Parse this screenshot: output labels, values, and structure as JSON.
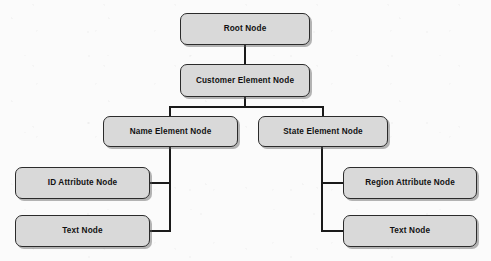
{
  "diagram": {
    "type": "tree-diagram",
    "colors": {
      "node_fill": "#d9d9d9",
      "node_border": "#2b2b2b",
      "edge": "#1a1a1a",
      "background": "#fbfbfb",
      "text": "#111111",
      "shadow": "#5a5a5a"
    },
    "nodes": [
      {
        "id": "root",
        "label": "Root Node",
        "x": 180,
        "y": 13,
        "w": 130,
        "h": 32
      },
      {
        "id": "customer",
        "label": "Customer Element Node",
        "x": 180,
        "y": 64,
        "w": 130,
        "h": 33
      },
      {
        "id": "name",
        "label": "Name Element Node",
        "x": 103,
        "y": 116,
        "w": 135,
        "h": 31
      },
      {
        "id": "state",
        "label": "State Element Node",
        "x": 258,
        "y": 116,
        "w": 130,
        "h": 31
      },
      {
        "id": "id_attr",
        "label": "ID Attribute Node",
        "x": 15,
        "y": 167,
        "w": 135,
        "h": 32
      },
      {
        "id": "text_left",
        "label": "Text Node",
        "x": 15,
        "y": 215,
        "w": 135,
        "h": 32
      },
      {
        "id": "region",
        "label": "Region Attribute Node",
        "x": 343,
        "y": 167,
        "w": 134,
        "h": 32
      },
      {
        "id": "text_right",
        "label": "Text Node",
        "x": 343,
        "y": 215,
        "w": 134,
        "h": 32
      }
    ],
    "edges": [
      {
        "id": "root-to-customer",
        "from": "root",
        "to": "customer",
        "path": "M245,45 L245,64"
      },
      {
        "id": "customer-to-branch",
        "from": "customer",
        "to": "branch-bar",
        "path": "M245,97 L245,107"
      },
      {
        "id": "branch-bar",
        "from": "customer",
        "to": "children",
        "path": "M170,107 L323,107"
      },
      {
        "id": "branch-to-name",
        "from": "branch-bar",
        "to": "name",
        "path": "M170,107 L170,116"
      },
      {
        "id": "branch-to-state",
        "from": "branch-bar",
        "to": "state",
        "path": "M323,107 L323,116"
      },
      {
        "id": "name-stem",
        "from": "name",
        "to": "name-children",
        "path": "M170,147 L170,231"
      },
      {
        "id": "name-to-id-attr",
        "from": "name",
        "to": "id_attr",
        "path": "M170,183 L150,183"
      },
      {
        "id": "name-to-text",
        "from": "name",
        "to": "text_left",
        "path": "M170,231 L150,231"
      },
      {
        "id": "state-stem",
        "from": "state",
        "to": "state-children",
        "path": "M322,147 L322,231"
      },
      {
        "id": "state-to-region",
        "from": "state",
        "to": "region",
        "path": "M322,183 L343,183"
      },
      {
        "id": "state-to-text",
        "from": "state",
        "to": "text_right",
        "path": "M322,231 L343,231"
      }
    ]
  }
}
